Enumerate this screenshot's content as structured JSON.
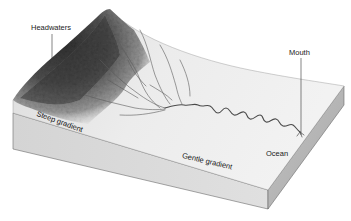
{
  "figure": {
    "labels": {
      "headwaters": "Headwaters",
      "mouth": "Mouth",
      "steep_gradient": "Steep gradient",
      "gentle_gradient": "Gentle gradient",
      "ocean": "Ocean"
    },
    "colors": {
      "mountain_dark": "#3a3a3a",
      "mountain_mid": "#7a7a7a",
      "plain_surface": "#e9e9e9",
      "block_front": "#d6d6d6",
      "block_side": "#b5b5b5",
      "river": "#555555",
      "leader_line": "#333333"
    }
  }
}
